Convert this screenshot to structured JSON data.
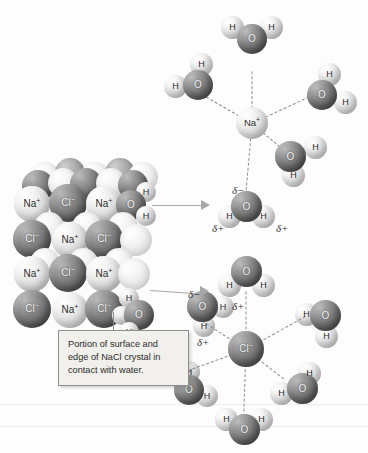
{
  "figure": {
    "background_color": "#fdfdfd",
    "caption": "Portion of surface and edge of NaCl crystal in contact with water."
  },
  "labels": {
    "sodium": "Na",
    "sodium_charge": "+",
    "chloride": "Cl",
    "chloride_charge": "−",
    "oxygen": "O",
    "hydrogen": "H",
    "delta_negative": "δ−",
    "delta_positive": "δ+"
  },
  "colors": {
    "dark_sphere": "#7e7e7e",
    "light_sphere": "#e2e2e2",
    "bond_dash": "#8d8d8d",
    "arrow": "#a8a8a8",
    "caption_fill": "#f2f0ec",
    "caption_border": "#8e8e8e",
    "text": "#2a2a2a"
  },
  "crystal": {
    "name": "NaCl crystal lattice",
    "rows": [
      {
        "ions": [
          "Na",
          "Cl",
          "Na"
        ]
      },
      {
        "ions": [
          "Cl",
          "Na",
          "Cl"
        ]
      },
      {
        "ions": [
          "Na",
          "Cl",
          "Na"
        ]
      },
      {
        "ions": [
          "Cl",
          "Na",
          "Cl"
        ]
      }
    ],
    "edge_water_count": 2
  },
  "sodium_cluster": {
    "ion_label": "Na",
    "ion_charge": "+",
    "water_count": 5,
    "orientation_note": "oxygen atoms point toward the cation",
    "charges": [
      {
        "text": "δ−",
        "on": "oxygen"
      },
      {
        "text": "δ+",
        "on": "hydrogen-left"
      },
      {
        "text": "δ+",
        "on": "hydrogen-right"
      }
    ]
  },
  "chloride_cluster": {
    "ion_label": "Cl",
    "ion_charge": "−",
    "water_count": 5,
    "orientation_note": "hydrogen atoms point toward the anion",
    "charges": [
      {
        "text": "δ−",
        "on": "oxygen"
      },
      {
        "text": "δ+",
        "on": "hydrogen-right"
      },
      {
        "text": "δ+",
        "on": "hydrogen-lower"
      }
    ]
  },
  "arrows": [
    {
      "name": "arrow-to-sodium-cluster"
    },
    {
      "name": "arrow-to-chloride-cluster"
    }
  ]
}
